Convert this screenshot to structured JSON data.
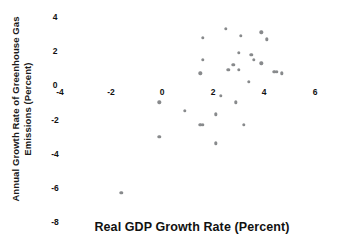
{
  "chart_data": {
    "type": "scatter",
    "title": "",
    "xlabel": "Real GDP Growth Rate (Percent)",
    "ylabel": "Annual Growth Rate of Greenhouse Gas Emissions (Percent)",
    "ylabel_line1": "Annual Growth Rate of Greenhouse Gas",
    "ylabel_line2": "Emissions (Percent)",
    "xlim": [
      -4,
      6
    ],
    "ylim": [
      -8,
      4
    ],
    "xticks": [
      -4,
      -2,
      0,
      2,
      4,
      6
    ],
    "yticks": [
      4,
      2,
      0,
      -2,
      -4,
      -6,
      -8
    ],
    "xtick_labels": [
      "-4",
      "-2",
      "0",
      "2",
      "4",
      "6"
    ],
    "ytick_labels": [
      "4",
      "2",
      "0",
      "-2",
      "-4",
      "-6",
      "-8"
    ],
    "grid": false,
    "legend": null,
    "marker_color": "#888a8c",
    "marker_size": 3.4,
    "points": [
      {
        "x": -1.6,
        "y": -6.3
      },
      {
        "x": -0.1,
        "y": -1.0
      },
      {
        "x": -0.1,
        "y": -3.0
      },
      {
        "x": 0.9,
        "y": -1.5
      },
      {
        "x": 1.5,
        "y": -2.3
      },
      {
        "x": 1.6,
        "y": -2.3
      },
      {
        "x": 1.5,
        "y": 0.7
      },
      {
        "x": 1.6,
        "y": 1.5
      },
      {
        "x": 1.6,
        "y": 2.8
      },
      {
        "x": 2.1,
        "y": -1.7
      },
      {
        "x": 2.1,
        "y": -3.4
      },
      {
        "x": 2.3,
        "y": -0.6
      },
      {
        "x": 2.5,
        "y": 3.3
      },
      {
        "x": 2.6,
        "y": 0.9
      },
      {
        "x": 2.8,
        "y": 1.2
      },
      {
        "x": 2.9,
        "y": -1.0
      },
      {
        "x": 3.0,
        "y": 0.9
      },
      {
        "x": 3.0,
        "y": 1.9
      },
      {
        "x": 3.1,
        "y": 2.9
      },
      {
        "x": 3.2,
        "y": -2.3
      },
      {
        "x": 3.4,
        "y": 0.2
      },
      {
        "x": 3.5,
        "y": 1.8
      },
      {
        "x": 3.6,
        "y": 1.5
      },
      {
        "x": 3.9,
        "y": 3.1
      },
      {
        "x": 3.9,
        "y": 1.3
      },
      {
        "x": 4.1,
        "y": 2.7
      },
      {
        "x": 4.4,
        "y": 0.8
      },
      {
        "x": 4.5,
        "y": 0.8
      },
      {
        "x": 4.7,
        "y": 0.7
      }
    ]
  }
}
